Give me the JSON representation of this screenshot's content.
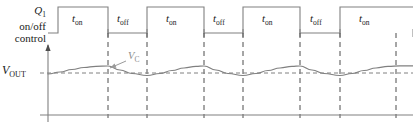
{
  "figure": {
    "background": "#ffffff",
    "width": 413,
    "height": 131
  },
  "labels": {
    "control_line1": "Q",
    "control_line1_sub": "1",
    "control_line2": "on/off",
    "control_line3": "control",
    "vout": "V",
    "vout_sub": "OUT",
    "vc": "V",
    "vc_sub": "C"
  },
  "colors": {
    "line": "#808080",
    "axis": "#808080",
    "text": "#1a1a1a",
    "annotation": "#8c8c8c",
    "dashed": "#4d4d4d",
    "background": "#ffffff"
  },
  "switch_waveform": {
    "name": "Q1-on-off-control",
    "high_y": 7,
    "low_y": 33,
    "start_x": 48,
    "end_x": 413,
    "segments": [
      {
        "label": "t",
        "sub": "on",
        "state": "high",
        "x_start": 58,
        "x_end": 108,
        "label_x": 72
      },
      {
        "label": "t",
        "sub": "off",
        "state": "low",
        "x_start": 108,
        "x_end": 147,
        "label_x": 117
      },
      {
        "label": "t",
        "sub": "on",
        "state": "high",
        "x_start": 147,
        "x_end": 204,
        "label_x": 166
      },
      {
        "label": "t",
        "sub": "off",
        "state": "low",
        "x_start": 204,
        "x_end": 243,
        "label_x": 213
      },
      {
        "label": "t",
        "sub": "on",
        "state": "high",
        "x_start": 243,
        "x_end": 300,
        "label_x": 262
      },
      {
        "label": "t",
        "sub": "off",
        "state": "low",
        "x_start": 300,
        "x_end": 340,
        "label_x": 310
      },
      {
        "label": "t",
        "sub": "on",
        "state": "high",
        "x_start": 340,
        "x_end": 396,
        "label_x": 359
      }
    ]
  },
  "chart_data": {
    "type": "line",
    "title": "",
    "xlabel": "",
    "ylabel": "",
    "grid": false,
    "legend": "none",
    "axes": {
      "origin_x": 48,
      "origin_y": 115,
      "x_axis_y": 115,
      "x_axis_x_end": 413,
      "y_axis_top": 45,
      "arrow": "up"
    },
    "series": [
      {
        "name": "V_C output ripple",
        "color": "#808080",
        "points": [
          [
            48,
            74
          ],
          [
            60,
            72
          ],
          [
            72,
            69.5
          ],
          [
            84,
            67.5
          ],
          [
            96,
            66.3
          ],
          [
            108,
            66
          ],
          [
            120,
            70
          ],
          [
            132,
            73.5
          ],
          [
            147,
            75.5
          ],
          [
            160,
            73.5
          ],
          [
            172,
            70.5
          ],
          [
            184,
            68
          ],
          [
            196,
            66.4
          ],
          [
            204,
            66
          ],
          [
            216,
            70
          ],
          [
            228,
            73.5
          ],
          [
            243,
            75.5
          ],
          [
            256,
            73.5
          ],
          [
            268,
            70.5
          ],
          [
            280,
            68
          ],
          [
            292,
            66.4
          ],
          [
            300,
            66
          ],
          [
            312,
            70
          ],
          [
            324,
            73.5
          ],
          [
            340,
            75.5
          ],
          [
            352,
            73.5
          ],
          [
            364,
            70.5
          ],
          [
            376,
            68
          ],
          [
            388,
            66.4
          ],
          [
            400,
            65.8
          ],
          [
            413,
            65.8
          ]
        ]
      }
    ],
    "reference_line": {
      "name": "V_OUT average",
      "y": 73,
      "x_start": 40,
      "x_end": 413,
      "style": "dashed"
    },
    "dashed_verticals": {
      "name": "switching-transition-markers",
      "y_top": 33,
      "y_bottom": 118,
      "x_positions": [
        108,
        147,
        204,
        243,
        300,
        340,
        396
      ]
    },
    "annotation": {
      "text": "V_C",
      "label_x": 128,
      "label_y": 55,
      "leader_from": [
        126,
        61
      ],
      "leader_to": [
        110,
        68
      ],
      "arrowhead": true
    }
  }
}
